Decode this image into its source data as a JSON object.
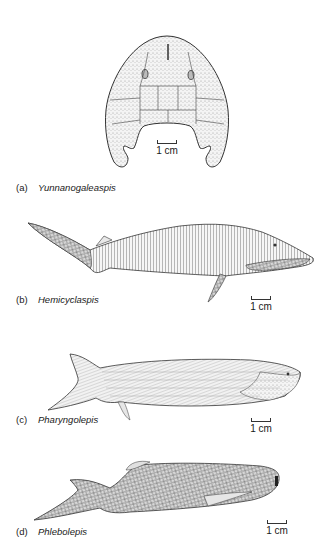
{
  "figure": {
    "panels": [
      {
        "tag": "(a)",
        "name": "Yunnanogaleaspis",
        "scale": "1 cm"
      },
      {
        "tag": "(b)",
        "name": "Hemicyclaspis",
        "scale": "1 cm"
      },
      {
        "tag": "(c)",
        "name": "Pharyngolepis",
        "scale": "1 cm"
      },
      {
        "tag": "(d)",
        "name": "Phlebolepis",
        "scale": "1 cm"
      }
    ],
    "colors": {
      "ink": "#1a1a1a",
      "stipple": "#cfcfcf",
      "paper": "#ffffff"
    }
  }
}
